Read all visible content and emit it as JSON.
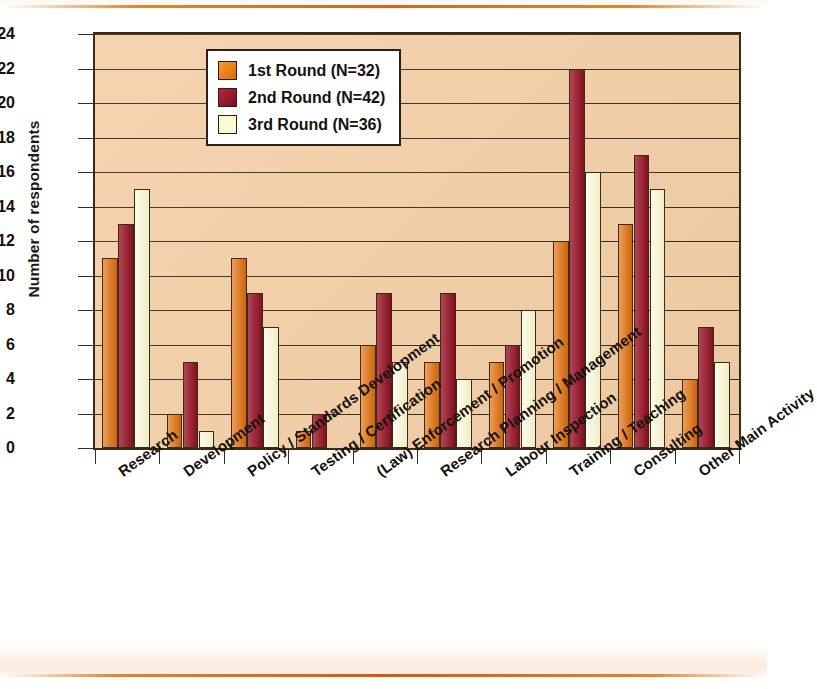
{
  "chart_data": {
    "type": "bar",
    "title": "",
    "xlabel": "",
    "ylabel": "Number of respondents",
    "ylim": [
      0,
      24
    ],
    "ytick_step": 2,
    "yticks": [
      24,
      22,
      20,
      18,
      16,
      14,
      12,
      10,
      8,
      6,
      4,
      2,
      0
    ],
    "grid": true,
    "legend_position": "top-center-inside",
    "categories": [
      "Research",
      "Development",
      "Policy / Standards Development",
      "Testing / Certification",
      "(Law) Enforcement / Promotion",
      "Research Planning / Management",
      "Labour Inspection",
      "Training / Teaching",
      "Consulting",
      "Other Main Activity"
    ],
    "series": [
      {
        "name": "1st Round (N=32)",
        "color": "#e8730c",
        "values": [
          11,
          2,
          11,
          1,
          6,
          5,
          5,
          12,
          13,
          4
        ]
      },
      {
        "name": "2nd Round (N=42)",
        "color": "#9c1126",
        "values": [
          13,
          5,
          9,
          2,
          9,
          9,
          6,
          22,
          17,
          7
        ]
      },
      {
        "name": "3rd Round (N=36)",
        "color": "#fbfad2",
        "values": [
          15,
          1,
          7,
          0,
          5,
          4,
          8,
          16,
          15,
          5
        ]
      }
    ]
  },
  "legend": {
    "items": [
      {
        "label": "1st Round (N=32)",
        "swatch": "legend-swatch-1st-round"
      },
      {
        "label": "2nd Round (N=42)",
        "swatch": "legend-swatch-2nd-round"
      },
      {
        "label": "3rd Round (N=36)",
        "swatch": "legend-swatch-3rd-round"
      }
    ]
  },
  "axes": {
    "y_title": "Number of respondents"
  },
  "colors": {
    "plot_background": "#f3cfa6",
    "axis": "#3b2a18",
    "round1": "#e8730c",
    "round2": "#9c1126",
    "round3": "#fbfad2",
    "page_rule": "#e06010"
  }
}
